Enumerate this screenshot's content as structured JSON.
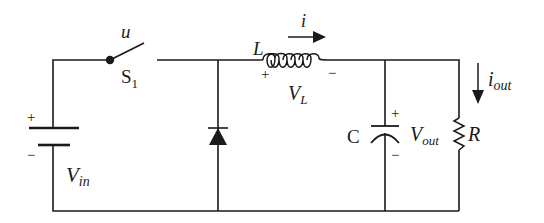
{
  "diagram": {
    "type": "buck converter circuit schematic",
    "colors": {
      "line": "#1a1a1a",
      "background": "#ffffff"
    },
    "components": {
      "source": {
        "label_main": "V",
        "label_sub": "in",
        "plus": "+",
        "minus": "−"
      },
      "switch": {
        "label_main": "S",
        "label_sub": "1",
        "control": "u"
      },
      "diode": {
        "label": ""
      },
      "inductor": {
        "label": "L",
        "current": "i",
        "voltage_main": "V",
        "voltage_sub": "L",
        "plus": "+",
        "minus": "−"
      },
      "capacitor": {
        "label": "C",
        "voltage_main": "V",
        "voltage_sub": "out",
        "plus": "+",
        "minus": "−"
      },
      "resistor": {
        "label": "R",
        "current_main": "i",
        "current_sub": "out"
      }
    }
  }
}
